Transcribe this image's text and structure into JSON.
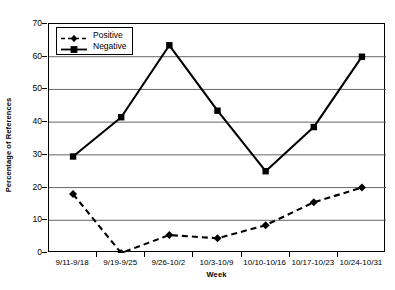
{
  "chart_data": {
    "type": "line",
    "title": "",
    "xlabel": "Week",
    "ylabel": "Percentage of References",
    "categories": [
      "9/11-9/18",
      "9/19-9/25",
      "9/26-10/2",
      "10/3-10/9",
      "10/10-10/16",
      "10/17-10/23",
      "10/24-10/31"
    ],
    "ylim": [
      0,
      70
    ],
    "yticks": [
      0,
      10,
      20,
      30,
      40,
      50,
      60,
      70
    ],
    "grid": "horizontal",
    "legend_position": "top-left",
    "series": [
      {
        "name": "Positive",
        "marker": "diamond",
        "linestyle": "dashed",
        "color": "#000000",
        "values": [
          18,
          0,
          5.5,
          4.5,
          8.5,
          15.5,
          20
        ]
      },
      {
        "name": "Negative",
        "marker": "square",
        "linestyle": "solid",
        "color": "#000000",
        "values": [
          29.5,
          41.5,
          63.5,
          43.5,
          25,
          38.5,
          60
        ]
      }
    ]
  },
  "legend": {
    "items": [
      {
        "label": "Positive"
      },
      {
        "label": "Negative"
      }
    ]
  },
  "axes": {
    "y_title": "Percentage of References",
    "x_title": "Week",
    "y_tick_labels": [
      "70",
      "60",
      "50",
      "40",
      "30",
      "20",
      "10",
      "0"
    ],
    "x_tick_labels": [
      "9/11-9/18",
      "9/19-9/25",
      "9/26-10/2",
      "10/3-10/9",
      "10/10-10/16",
      "10/17-10/23",
      "10/24-10/31"
    ]
  }
}
